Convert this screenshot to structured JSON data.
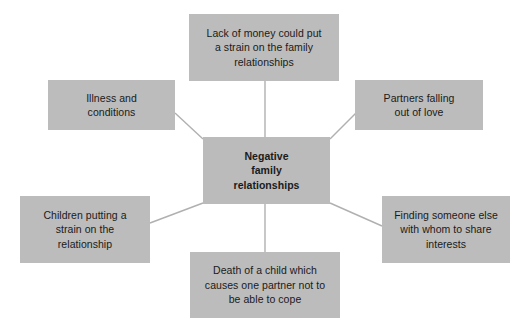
{
  "diagram": {
    "type": "spider-diagram",
    "title": "Negative family relationships",
    "box_fill_color": "#bcbcbc",
    "connector_color": "#b0b0b0",
    "background_color": "#ffffff",
    "text_color": "#1a1a1a",
    "center": {
      "id": "negative-family-relationships",
      "label": "Negative\nfamily\nrelationships",
      "bold": true
    },
    "branches": [
      {
        "id": "lack-of-money",
        "position": "top",
        "label": "Lack of money could put\na strain on the family\nrelationships"
      },
      {
        "id": "illness-and-conditions",
        "position": "left-upper",
        "label": "Illness and\nconditions"
      },
      {
        "id": "partners-falling-out-of-love",
        "position": "right-upper",
        "label": "Partners falling\nout of love"
      },
      {
        "id": "children-putting-a-strain",
        "position": "left-lower",
        "label": "Children putting a\nstrain on the\nrelationship"
      },
      {
        "id": "finding-someone-else",
        "position": "right-lower",
        "label": "Finding someone else\nwith whom to share\ninterests"
      },
      {
        "id": "death-of-a-child",
        "position": "bottom",
        "label": "Death of a child which\ncauses one partner not to\nbe able to cope"
      }
    ]
  }
}
